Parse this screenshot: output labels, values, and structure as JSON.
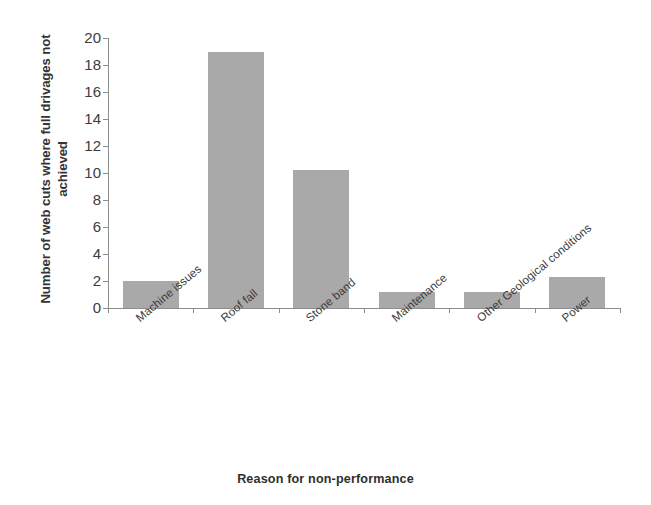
{
  "chart_data": {
    "type": "bar",
    "title": "",
    "xlabel": "Reason for non-performance",
    "ylabel": "Number of web cuts where full drivages not achieved",
    "categories": [
      "Machine issues",
      "Roof fall",
      "Stone band",
      "Maintenance",
      "Other Geological conditions",
      "Power"
    ],
    "values": [
      2.0,
      19.0,
      10.2,
      1.2,
      1.2,
      2.3
    ],
    "ylim": [
      0,
      20
    ],
    "ytick_labels": [
      "20",
      "18",
      "16",
      "14",
      "12",
      "10",
      "8",
      "6",
      "4",
      "2",
      "0"
    ],
    "ytick_values": [
      20,
      18,
      16,
      14,
      12,
      10,
      8,
      6,
      4,
      2,
      0
    ],
    "grid": false,
    "legend": false,
    "bar_color": "#a9a9a9",
    "axis_color": "#8d8d8d",
    "text_color": "#3a3a3a"
  },
  "axes": {
    "y_title": "Number of web cuts where full drivages not achieved",
    "x_title": "Reason for non-performance"
  }
}
